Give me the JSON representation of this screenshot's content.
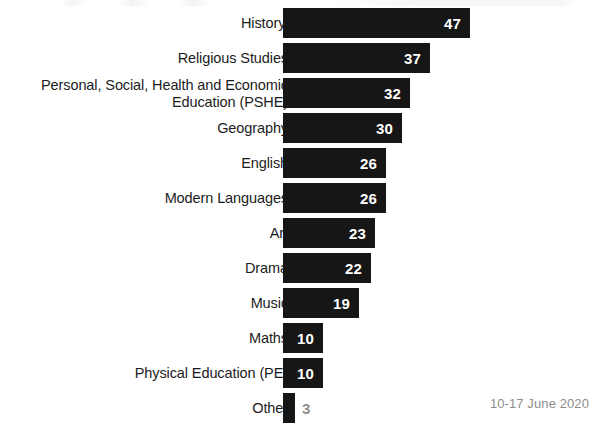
{
  "chart_data": {
    "type": "bar",
    "orientation": "horizontal",
    "title": "",
    "xlabel": "",
    "ylabel": "",
    "grid": false,
    "legend": null,
    "axis_visible": false,
    "value_labels_inside_bar": true,
    "xlim": [
      0,
      47
    ],
    "bar_color": "#161616",
    "inside_label_color": "#ffffff",
    "outside_label_color": "#8e8e8e",
    "categories": [
      "History'",
      "Religious Studies",
      "Personal, Social, Health and Economic\nEducation (PSHE)",
      "Geography",
      "English",
      "Modern Languages",
      "Art",
      "Drama",
      "Music",
      "Maths",
      "Physical Education (PE)",
      "Other"
    ],
    "values": [
      47,
      37,
      32,
      30,
      26,
      26,
      23,
      22,
      19,
      10,
      10,
      3
    ],
    "annotations": {
      "date_range": "10-17 June 2020"
    }
  },
  "bars": [
    {
      "label": "History'",
      "value": "47",
      "value_outside": false
    },
    {
      "label": "Religious Studies",
      "value": "37",
      "value_outside": false
    },
    {
      "label": "Personal, Social, Health and Economic\nEducation (PSHE)",
      "value": "32",
      "value_outside": false
    },
    {
      "label": "Geography",
      "value": "30",
      "value_outside": false
    },
    {
      "label": "English",
      "value": "26",
      "value_outside": false
    },
    {
      "label": "Modern Languages",
      "value": "26",
      "value_outside": false
    },
    {
      "label": "Art",
      "value": "23",
      "value_outside": false
    },
    {
      "label": "Drama",
      "value": "22",
      "value_outside": false
    },
    {
      "label": "Music",
      "value": "19",
      "value_outside": false
    },
    {
      "label": "Maths",
      "value": "10",
      "value_outside": false
    },
    {
      "label": "Physical Education (PE)",
      "value": "10",
      "value_outside": false
    },
    {
      "label": "Other",
      "value": "3",
      "value_outside": true
    }
  ],
  "footnote": {
    "date": "10-17 June 2020"
  }
}
